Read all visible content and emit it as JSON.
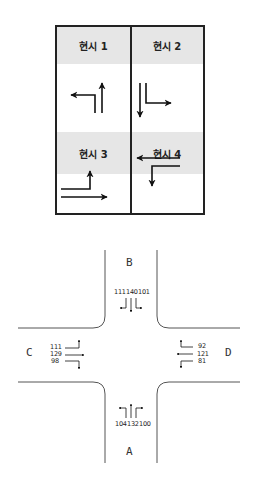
{
  "phase_table": {
    "phases": [
      {
        "label": "현시 1",
        "movements": [
          "left-turn-west",
          "through-north"
        ]
      },
      {
        "label": "현시 2",
        "movements": [
          "through-south",
          "right-turn-east"
        ]
      },
      {
        "label": "현시 3",
        "movements": [
          "left-turn-north-from-east",
          "through-east"
        ]
      },
      {
        "label": "현시 4",
        "movements": [
          "through-west",
          "left-turn-south"
        ]
      }
    ]
  },
  "intersection": {
    "approaches": {
      "A": {
        "label": "A",
        "volumes": {
          "left": "104",
          "through": "132",
          "right": "100"
        }
      },
      "B": {
        "label": "B",
        "volumes": {
          "right": "111",
          "through": "140",
          "left": "101"
        }
      },
      "C": {
        "label": "C",
        "volumes": {
          "left": "111",
          "through": "129",
          "right": "98"
        }
      },
      "D": {
        "label": "D",
        "volumes": {
          "right": "92",
          "through": "121",
          "left": "81"
        }
      }
    }
  },
  "colors": {
    "line": "#222222",
    "header_bg": "#e6e6e6",
    "road": "#555555"
  }
}
